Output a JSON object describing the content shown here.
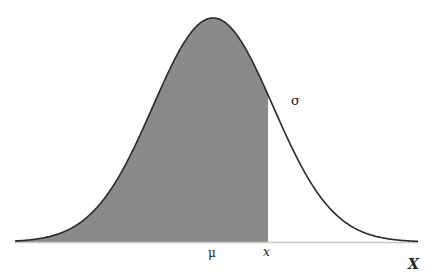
{
  "figure": {
    "labels": {
      "mean": "μ",
      "point": "x",
      "std_dev": "σ",
      "axis": "X"
    },
    "colors": {
      "shaded_fill": "#8a8a8a",
      "curve_stroke": "#2a2a2a",
      "baseline": "#c8c8c8",
      "background": "#ffffff"
    },
    "geometry": {
      "x_start": 15,
      "x_end": 418,
      "mean_px": 213,
      "sigma_px": 60,
      "peak_y": 18,
      "baseline_y": 242,
      "shade_to_px": 268
    }
  }
}
